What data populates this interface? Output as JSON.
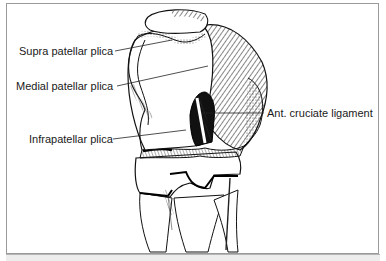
{
  "figure": {
    "labels": [
      {
        "id": "supra",
        "text": "Supra patellar plica"
      },
      {
        "id": "medial",
        "text": "Medial patellar plica"
      },
      {
        "id": "infra",
        "text": "Infrapatellar plica"
      },
      {
        "id": "acl",
        "text": "Ant. cruciate ligament"
      }
    ]
  }
}
